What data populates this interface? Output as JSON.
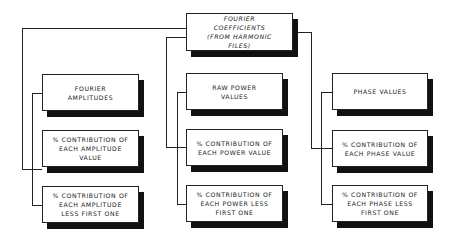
{
  "diagram": {
    "root": {
      "label": "FOURIER\nCOEFFICIENTS\n(FROM HARMONIC\nFILES)"
    },
    "columns": [
      {
        "name": "amplitude",
        "boxes": [
          {
            "label": "FOURIER\nAMPLITUDES"
          },
          {
            "label": "% CONTRIBUTION OF\nEACH AMPLITUDE\nVALUE"
          },
          {
            "label": "% CONTRIBUTION OF\nEACH AMPLITUDE\nLESS FIRST ONE"
          }
        ]
      },
      {
        "name": "power",
        "boxes": [
          {
            "label": "RAW POWER\nVALUES"
          },
          {
            "label": "% CONTRIBUTION OF\nEACH POWER VALUE"
          },
          {
            "label": "% CONTRIBUTION OF\nEACH POWER LESS\nFIRST ONE"
          }
        ]
      },
      {
        "name": "phase",
        "boxes": [
          {
            "label": "PHASE VALUES"
          },
          {
            "label": "% CONTRIBUTION OF\nEACH PHASE VALUE"
          },
          {
            "label": "% CONTRIBUTION OF\nEACH PHASE LESS\nFIRST ONE"
          }
        ]
      }
    ]
  }
}
